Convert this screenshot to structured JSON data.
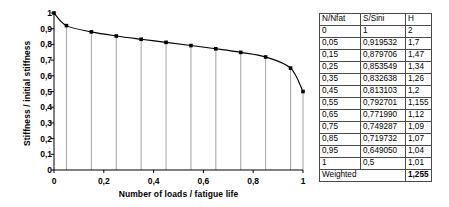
{
  "chart_data": {
    "type": "line",
    "title": "",
    "xlabel": "Number of loads / fatigue life",
    "ylabel": "Stiffness / initial stiffness",
    "xlim": [
      0,
      1
    ],
    "ylim": [
      0,
      1
    ],
    "grid": false,
    "legend": "none",
    "markers": "filled-square",
    "drop_lines": true,
    "xticks": [
      "0",
      "0,2",
      "0,4",
      "0,6",
      "0,8",
      "1"
    ],
    "xtick_values": [
      0,
      0.2,
      0.4,
      0.6,
      0.8,
      1
    ],
    "yticks": [
      "0",
      "0,1",
      "0,2",
      "0,3",
      "0,4",
      "0,5",
      "0,6",
      "0,7",
      "0,8",
      "0,9",
      "1"
    ],
    "ytick_values": [
      0,
      0.1,
      0.2,
      0.3,
      0.4,
      0.5,
      0.6,
      0.7,
      0.8,
      0.9,
      1
    ],
    "x": [
      0,
      0.05,
      0.15,
      0.25,
      0.35,
      0.45,
      0.55,
      0.65,
      0.75,
      0.85,
      0.95,
      1
    ],
    "values": [
      1,
      0.919532,
      0.879706,
      0.853549,
      0.832638,
      0.813103,
      0.792701,
      0.77199,
      0.749287,
      0.719732,
      0.64905,
      0.5
    ],
    "series": [
      {
        "name": "S/Sini",
        "values": [
          1,
          0.919532,
          0.879706,
          0.853549,
          0.832638,
          0.813103,
          0.792701,
          0.77199,
          0.749287,
          0.719732,
          0.64905,
          0.5
        ]
      }
    ]
  },
  "table": {
    "headers": [
      "N/Nfat",
      "S/Sini",
      "H"
    ],
    "rows": [
      [
        "0",
        "1",
        "2"
      ],
      [
        "0,05",
        "0,919532",
        "1,7"
      ],
      [
        "0,15",
        "0,879706",
        "1,47"
      ],
      [
        "0,25",
        "0,853549",
        "1,34"
      ],
      [
        "0,35",
        "0,832638",
        "1,26"
      ],
      [
        "0,45",
        "0,813103",
        "1,2"
      ],
      [
        "0,55",
        "0,792701",
        "1,155"
      ],
      [
        "0,65",
        "0,771990",
        "1,12"
      ],
      [
        "0,75",
        "0,749287",
        "1,09"
      ],
      [
        "0,85",
        "0,719732",
        "1,07"
      ],
      [
        "0,95",
        "0,649050",
        "1,04"
      ],
      [
        "1",
        "0,5",
        "1,01"
      ]
    ],
    "summary": {
      "label": "Weighted",
      "value": "1,255"
    }
  },
  "colors": {
    "line": "#000000",
    "marker": "#000000",
    "axis": "#000000",
    "dropline": "#808080",
    "table_border": "#4a4a4a",
    "background": "#ffffff"
  }
}
